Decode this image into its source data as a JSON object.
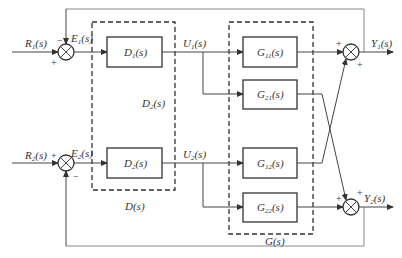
{
  "diagram": {
    "type": "block-diagram",
    "header_text_cut": "",
    "inputs": [
      {
        "id": "R1",
        "label": "R",
        "sub": "1",
        "arg": "(s)"
      },
      {
        "id": "R2",
        "label": "R",
        "sub": "2",
        "arg": "(s)"
      }
    ],
    "errors": [
      {
        "id": "E1",
        "label": "E",
        "sub": "1",
        "arg": "(s)"
      },
      {
        "id": "E2",
        "label": "E",
        "sub": "2",
        "arg": "(s)"
      }
    ],
    "controls": [
      {
        "id": "U1",
        "label": "U",
        "sub": "1",
        "arg": "(s)"
      },
      {
        "id": "U2",
        "label": "U",
        "sub": "2",
        "arg": "(s)"
      }
    ],
    "outputs": [
      {
        "id": "Y1",
        "label": "Y",
        "sub": "1",
        "arg": "(s)"
      },
      {
        "id": "Y2",
        "label": "Y",
        "sub": "2",
        "arg": "(s)"
      }
    ],
    "blocks": {
      "D1": {
        "label": "D",
        "sub": "1",
        "arg": "(s)"
      },
      "D2": {
        "label": "D",
        "sub": "2",
        "arg": "(s)"
      },
      "G11": {
        "label": "G",
        "sub": "11",
        "arg": "(s)"
      },
      "G21": {
        "label": "G",
        "sub": "21",
        "arg": "(s)"
      },
      "G12": {
        "label": "G",
        "sub": "12",
        "arg": "(s)"
      },
      "G22": {
        "label": "G",
        "sub": "22",
        "arg": "(s)"
      }
    },
    "groups": {
      "D": {
        "label": "D(s)",
        "inner_label": "D",
        "inner_sub": "2",
        "inner_arg": "(s)"
      },
      "G": {
        "label": "G(s)"
      }
    },
    "signs": {
      "sum1_top": "−",
      "sum1_left": "+",
      "sum2_left": "+",
      "sum2_bottom": "−",
      "out1_left": "+",
      "out1_bottom": "+",
      "out2_left": "+",
      "out2_top": "+"
    },
    "colors": {
      "line": "#333333",
      "frame": "#888888",
      "background": "#ffffff"
    }
  }
}
